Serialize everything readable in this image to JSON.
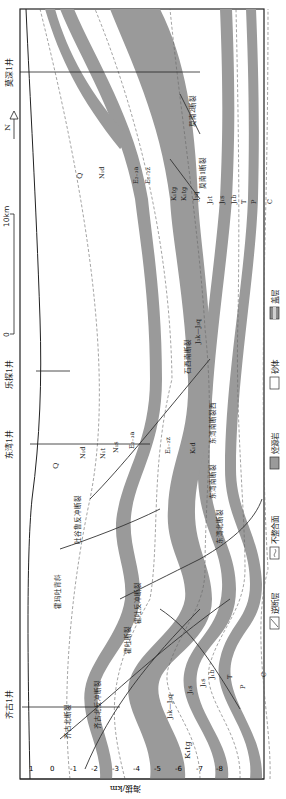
{
  "figure": {
    "orientation": "rotated-90-counterclockwise",
    "colors": {
      "source_rock": "#9a9a9a",
      "cap_rock": "#8c8c8c",
      "sandstone": "#ffffff",
      "frame": "#222222",
      "layer_line": "#555555"
    }
  },
  "wells": [
    {
      "label": "齐古1井",
      "pos": 0.115
    },
    {
      "label": "东湾1井",
      "pos": 0.445
    },
    {
      "label": "乐探1井",
      "pos": 0.535
    },
    {
      "label": "莫深1井",
      "pos": 0.91
    }
  ],
  "compass": {
    "label": "N"
  },
  "scale_bar": {
    "start": "0",
    "end": "10km"
  },
  "y_axis": {
    "title": "海拔/km",
    "ticks": [
      "1",
      "0",
      "-1",
      "-2",
      "-3",
      "-4",
      "-5",
      "-6",
      "-7",
      "-8"
    ]
  },
  "legend": [
    {
      "label": "逆断层",
      "icon": "reverse-fault-swatch"
    },
    {
      "label": "不整合面",
      "icon": "unconformity-swatch"
    },
    {
      "label": "烃源岩",
      "icon": "source-rock-swatch"
    },
    {
      "label": "砂体",
      "icon": "sandbody-swatch"
    },
    {
      "label": "盖层",
      "icon": "caprock-swatch"
    }
  ],
  "strata_labels_left": [
    {
      "text": "K₁tg",
      "x": 40,
      "y": 190
    },
    {
      "text": "J₃k—J₃q",
      "x": 90,
      "y": 170
    },
    {
      "text": "J₁s",
      "x": 108,
      "y": 188
    },
    {
      "text": "J₁s",
      "x": 115,
      "y": 205
    },
    {
      "text": "J₁b",
      "x": 122,
      "y": 212
    },
    {
      "text": "T",
      "x": 120,
      "y": 232
    },
    {
      "text": "P",
      "x": 110,
      "y": 243
    },
    {
      "text": "C",
      "x": 120,
      "y": 265
    }
  ],
  "strata_labels_mid": [
    {
      "text": "Q",
      "x": 330,
      "y": 55
    },
    {
      "text": "N₁d",
      "x": 345,
      "y": 85
    },
    {
      "text": "N₁t",
      "x": 345,
      "y": 107
    },
    {
      "text": "N₁s",
      "x": 352,
      "y": 120
    },
    {
      "text": "E₂₋₃a",
      "x": 355,
      "y": 135
    },
    {
      "text": "E₁₋₂z",
      "x": 345,
      "y": 170
    },
    {
      "text": "K₁d",
      "x": 345,
      "y": 195
    }
  ],
  "strata_labels_right": [
    {
      "text": "Q",
      "x": 620,
      "y": 80
    },
    {
      "text": "N₁d",
      "x": 620,
      "y": 104
    },
    {
      "text": "E₂₋₃a",
      "x": 620,
      "y": 140
    },
    {
      "text": "E₁₋₂z",
      "x": 620,
      "y": 150
    },
    {
      "text": "K₁tg",
      "x": 598,
      "y": 175
    },
    {
      "text": "K₁tg",
      "x": 598,
      "y": 185
    },
    {
      "text": "J₃q",
      "x": 598,
      "y": 198
    },
    {
      "text": "J₂t",
      "x": 595,
      "y": 213
    },
    {
      "text": "J₁s",
      "x": 595,
      "y": 225
    },
    {
      "text": "J₁b",
      "x": 595,
      "y": 236
    },
    {
      "text": "T",
      "x": 595,
      "y": 245
    },
    {
      "text": "P",
      "x": 595,
      "y": 253
    },
    {
      "text": "C",
      "x": 595,
      "y": 272
    },
    {
      "text": "J₃k—J₃q",
      "x": 455,
      "y": 200
    }
  ],
  "faults": [
    {
      "label": "齐古北断裂",
      "x": 65,
      "y": 70
    },
    {
      "label": "齐古北反冲断裂",
      "x": 75,
      "y": 100
    },
    {
      "label": "霍吐断裂",
      "x": 150,
      "y": 130
    },
    {
      "label": "霍吐反冲断裂",
      "x": 180,
      "y": 140
    },
    {
      "label": "霍玛吐背斜",
      "x": 200,
      "y": 60
    },
    {
      "label": "吐谷鲁反冲断裂",
      "x": 260,
      "y": 80
    },
    {
      "label": "东湾北断裂",
      "x": 260,
      "y": 220
    },
    {
      "label": "东湾南断裂",
      "x": 310,
      "y": 215
    },
    {
      "label": "东湾南断裂西",
      "x": 360,
      "y": 215
    },
    {
      "label": "石西南断裂",
      "x": 430,
      "y": 190
    },
    {
      "label": "莫南1断裂",
      "x": 615,
      "y": 210
    },
    {
      "label": "莫南2断裂",
      "x": 680,
      "y": 200
    }
  ]
}
